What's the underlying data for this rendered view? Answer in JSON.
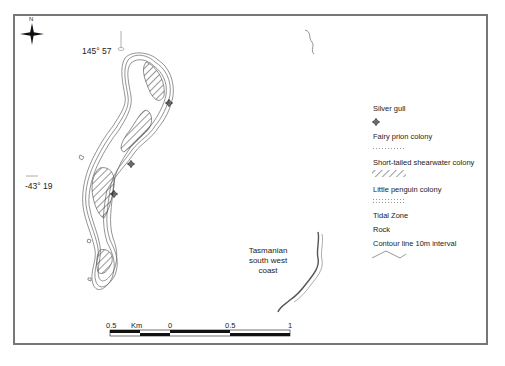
{
  "map": {
    "north_label": "N",
    "longitude_label": "145° 57",
    "latitude_label": "-43° 19",
    "mainland_label": [
      "Tasmanian",
      "south west",
      "coast"
    ]
  },
  "legend": {
    "items": [
      {
        "label": "Silver gull",
        "symbol": "crosshair-circle-icon"
      },
      {
        "label": "Fairy prion colony",
        "symbol": "dotted-hatch-pattern"
      },
      {
        "label": "Short-tailed shearwater colony",
        "symbol": "diagonal-hatch-pattern"
      },
      {
        "label": "Little penguin colony",
        "symbol": "dot-grid-pattern"
      },
      {
        "label": "Tidal Zone",
        "symbol": ""
      },
      {
        "label": "Rock",
        "symbol": ""
      },
      {
        "label": "Contour line 10m interval",
        "symbol": "contour-line"
      }
    ]
  },
  "scale_bar": {
    "unit": "Km",
    "ticks": [
      "0.5",
      "0",
      "0.5",
      "1"
    ]
  },
  "colors": {
    "frame": "#777777",
    "ink": "#222222",
    "contour": "#666666"
  }
}
